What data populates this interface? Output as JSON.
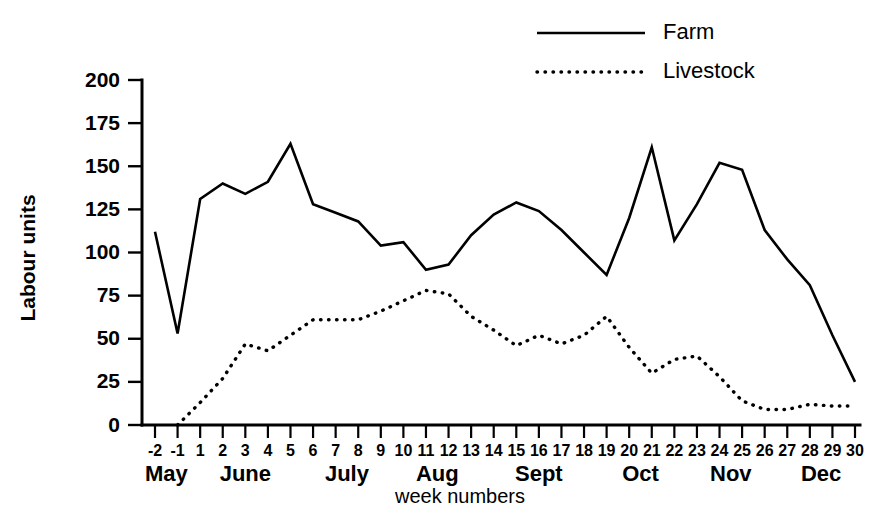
{
  "chart_data": {
    "type": "line",
    "title": "",
    "xlabel": "week numbers",
    "ylabel": "Labour units",
    "ylim": [
      0,
      200
    ],
    "yticks": [
      0,
      25,
      50,
      75,
      100,
      125,
      150,
      175,
      200
    ],
    "grid": false,
    "legend_position": "top-right",
    "x": [
      "-2",
      "-1",
      "1",
      "2",
      "3",
      "4",
      "5",
      "6",
      "7",
      "8",
      "9",
      "10",
      "11",
      "12",
      "13",
      "14",
      "15",
      "16",
      "17",
      "18",
      "19",
      "20",
      "21",
      "22",
      "23",
      "24",
      "25",
      "26",
      "27",
      "28",
      "29",
      "30"
    ],
    "categories": [
      "-2",
      "-1",
      "1",
      "2",
      "3",
      "4",
      "5",
      "6",
      "7",
      "8",
      "9",
      "10",
      "11",
      "12",
      "13",
      "14",
      "15",
      "16",
      "17",
      "18",
      "19",
      "20",
      "21",
      "22",
      "23",
      "24",
      "25",
      "26",
      "27",
      "28",
      "29",
      "30"
    ],
    "month_groups": [
      {
        "label": "May",
        "start_index": 0,
        "end_index": 1
      },
      {
        "label": "June",
        "start_index": 2,
        "end_index": 6
      },
      {
        "label": "July",
        "start_index": 7,
        "end_index": 10
      },
      {
        "label": "Aug",
        "start_index": 11,
        "end_index": 14
      },
      {
        "label": "Sept",
        "start_index": 15,
        "end_index": 19
      },
      {
        "label": "Oct",
        "start_index": 20,
        "end_index": 23
      },
      {
        "label": "Nov",
        "start_index": 24,
        "end_index": 27
      },
      {
        "label": "Dec",
        "start_index": 28,
        "end_index": 31
      }
    ],
    "series": [
      {
        "name": "Farm",
        "style": "solid",
        "color": "#000000",
        "values": [
          112,
          53,
          131,
          140,
          134,
          141,
          163,
          128,
          123,
          118,
          104,
          106,
          90,
          93,
          110,
          122,
          129,
          124,
          113,
          100,
          87,
          120,
          161,
          107,
          128,
          152,
          148,
          113,
          96,
          81,
          52,
          25
        ]
      },
      {
        "name": "Livestock",
        "style": "dotted",
        "color": "#000000",
        "values": [
          null,
          0,
          13,
          27,
          47,
          43,
          52,
          61,
          61,
          61,
          66,
          72,
          78,
          76,
          63,
          55,
          46,
          52,
          47,
          52,
          63,
          45,
          30,
          38,
          40,
          28,
          14,
          9,
          9,
          12,
          11,
          11
        ]
      }
    ],
    "legend": [
      {
        "label": "Farm",
        "style": "solid"
      },
      {
        "label": "Livestock",
        "style": "dotted"
      }
    ]
  }
}
